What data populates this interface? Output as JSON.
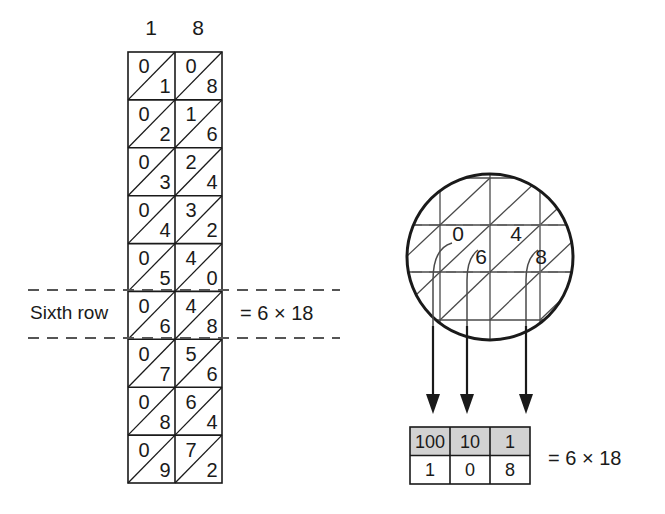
{
  "figure": {
    "ink_color": "#1a1a1a",
    "header_fill": "#d2d2d2"
  },
  "lattice": {
    "column_headers": [
      "1",
      "8"
    ],
    "rows": [
      {
        "row": 1,
        "cells": [
          {
            "upper": "0",
            "lower": "1"
          },
          {
            "upper": "0",
            "lower": "8"
          }
        ]
      },
      {
        "row": 2,
        "cells": [
          {
            "upper": "0",
            "lower": "2"
          },
          {
            "upper": "1",
            "lower": "6"
          }
        ]
      },
      {
        "row": 3,
        "cells": [
          {
            "upper": "0",
            "lower": "3"
          },
          {
            "upper": "2",
            "lower": "4"
          }
        ]
      },
      {
        "row": 4,
        "cells": [
          {
            "upper": "0",
            "lower": "4"
          },
          {
            "upper": "3",
            "lower": "2"
          }
        ]
      },
      {
        "row": 5,
        "cells": [
          {
            "upper": "0",
            "lower": "5"
          },
          {
            "upper": "4",
            "lower": "0"
          }
        ]
      },
      {
        "row": 6,
        "cells": [
          {
            "upper": "0",
            "lower": "6"
          },
          {
            "upper": "4",
            "lower": "8"
          }
        ]
      },
      {
        "row": 7,
        "cells": [
          {
            "upper": "0",
            "lower": "7"
          },
          {
            "upper": "5",
            "lower": "6"
          }
        ]
      },
      {
        "row": 8,
        "cells": [
          {
            "upper": "0",
            "lower": "8"
          },
          {
            "upper": "6",
            "lower": "4"
          }
        ]
      },
      {
        "row": 9,
        "cells": [
          {
            "upper": "0",
            "lower": "9"
          },
          {
            "upper": "7",
            "lower": "2"
          }
        ]
      }
    ]
  },
  "annotations": {
    "sixth_row_label": "Sixth row",
    "sixth_row_equation": "= 6 × 18"
  },
  "magnifier": {
    "digits": [
      "0",
      "6",
      "4",
      "8"
    ]
  },
  "place_value_table": {
    "headers": [
      "100",
      "10",
      "1"
    ],
    "values": [
      "1",
      "0",
      "8"
    ],
    "equation": "= 6 × 18"
  }
}
